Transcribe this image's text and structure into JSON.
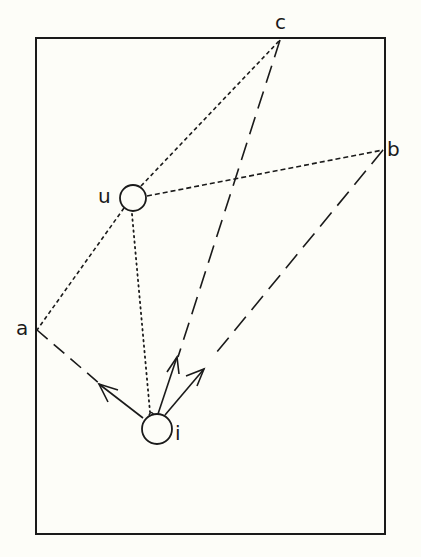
{
  "diagram": {
    "type": "geometric-reflection-diagram",
    "frame": {
      "left": 36,
      "top": 38,
      "right": 385,
      "bottom": 534
    },
    "points": {
      "a": {
        "label": "a",
        "x": 37,
        "y": 330
      },
      "b": {
        "label": "b",
        "x": 383,
        "y": 150
      },
      "c": {
        "label": "c",
        "x": 280,
        "y": 40
      }
    },
    "objects": {
      "u": {
        "label": "u",
        "cx": 133,
        "cy": 198,
        "r": 13
      },
      "i": {
        "label": "i",
        "cx": 157,
        "cy": 429,
        "r": 15
      }
    },
    "lines": [
      {
        "name": "u-to-c",
        "style": "short-dash"
      },
      {
        "name": "u-to-b",
        "style": "short-dash"
      },
      {
        "name": "u-to-a",
        "style": "short-dash"
      },
      {
        "name": "u-to-i",
        "style": "dotted"
      },
      {
        "name": "i-to-a",
        "style": "long-dash-arrow"
      },
      {
        "name": "i-to-c",
        "style": "long-dash-arrow"
      },
      {
        "name": "i-to-b",
        "style": "long-dash-arrow"
      }
    ],
    "colors": {
      "ink": "#1a1a1a",
      "paper": "#fdfdf8"
    }
  }
}
